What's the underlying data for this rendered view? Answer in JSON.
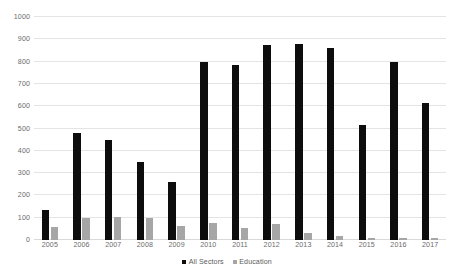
{
  "chart_data": {
    "type": "bar",
    "title": "",
    "xlabel": "",
    "ylabel": "",
    "categories": [
      "2005",
      "2006",
      "2007",
      "2008",
      "2009",
      "2010",
      "2011",
      "2012",
      "2013",
      "2014",
      "2015",
      "2016",
      "2017"
    ],
    "series": [
      {
        "name": "All Sectors",
        "color": "#0d0d0d",
        "values": [
          133,
          480,
          447,
          350,
          262,
          797,
          787,
          875,
          878,
          863,
          516,
          798,
          615
        ]
      },
      {
        "name": "Education",
        "color": "#a6a6a6",
        "values": [
          60,
          100,
          105,
          97,
          62,
          78,
          55,
          72,
          32,
          17,
          8,
          8,
          8
        ]
      }
    ],
    "ylim": [
      0,
      1000
    ],
    "ytick_labels": [
      "1000",
      "900",
      "800",
      "700",
      "600",
      "500",
      "400",
      "300",
      "200",
      "100",
      "0"
    ],
    "ytick_values": [
      1000,
      900,
      800,
      700,
      600,
      500,
      400,
      300,
      200,
      100,
      0
    ],
    "grid": true,
    "legend_position": "bottom"
  }
}
